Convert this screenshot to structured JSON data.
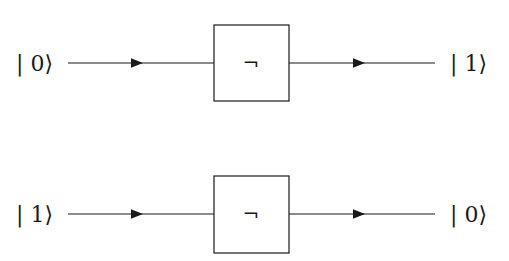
{
  "diagram": {
    "title": "",
    "rows": [
      {
        "input_label": "| 0⟩",
        "gate_symbol": "¬",
        "output_label": "| 1⟩"
      },
      {
        "input_label": "| 1⟩",
        "gate_symbol": "¬",
        "output_label": "| 0⟩"
      }
    ],
    "colors": {
      "stroke": "#1a1a1a",
      "background": "#ffffff"
    }
  }
}
